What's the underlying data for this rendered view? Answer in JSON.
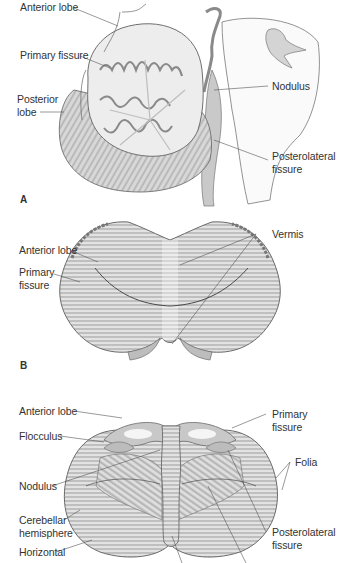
{
  "figure": {
    "panels": [
      {
        "letter": "A",
        "view": "midsagittal section",
        "labels": {
          "anterior_lobe": "Anterior lobe",
          "primary_fissure": "Primary fissure",
          "posterior_lobe_1": "Posterior",
          "posterior_lobe_2": "lobe",
          "nodulus": "Nodulus",
          "posterolateral_fissure_1": "Posterolateral",
          "posterolateral_fissure_2": "fissure"
        }
      },
      {
        "letter": "B",
        "view": "superior view",
        "labels": {
          "anterior_lobe": "Anterior lobe",
          "primary_fissure_1": "Primary",
          "primary_fissure_2": "fissure",
          "vermis": "Vermis"
        }
      },
      {
        "letter": "",
        "view": "inferior view",
        "labels": {
          "anterior_lobe": "Anterior lobe",
          "flocculus": "Flocculus",
          "nodulus": "Nodulus",
          "cerebellar_hemisphere_1": "Cerebellar",
          "cerebellar_hemisphere_2": "hemisphere",
          "horizontal": "Horizontal",
          "primary_fissure_1": "Primary",
          "primary_fissure_2": "fissure",
          "folia": "Folia",
          "posterolateral_fissure_1": "Posterolateral",
          "posterolateral_fissure_2": "fissure"
        }
      }
    ],
    "colors": {
      "tissue_fill": "#d9d9d9",
      "tissue_light": "#ececec",
      "tissue_stroke": "#6e6e6e",
      "leader_line": "#555555",
      "background": "#ffffff"
    }
  }
}
